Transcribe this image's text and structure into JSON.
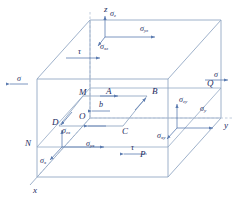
{
  "figure": {
    "type": "3d-stress-element-diagram",
    "colors": {
      "line": "#93a8c4",
      "dashed": "#b9c6d8",
      "arrow": "#5b7bb0",
      "label": "#1b2a5e",
      "background": "#ffffff"
    }
  },
  "axes": [
    {
      "name": "z-axis",
      "label": "z",
      "direction": "up"
    },
    {
      "name": "y-axis",
      "label": "y",
      "direction": "right"
    },
    {
      "name": "x-axis",
      "label": "x",
      "direction": "down-left"
    }
  ],
  "vertices": [
    {
      "name": "point-M",
      "label": "M"
    },
    {
      "name": "point-N",
      "label": "N"
    },
    {
      "name": "point-P",
      "label": "P"
    },
    {
      "name": "point-Q",
      "label": "Q"
    }
  ],
  "loop": {
    "name": "dislocation-loop",
    "corners": [
      {
        "name": "point-A",
        "label": "A"
      },
      {
        "name": "point-B",
        "label": "B"
      },
      {
        "name": "point-C",
        "label": "C"
      },
      {
        "name": "point-D",
        "label": "D"
      }
    ],
    "center": {
      "name": "point-O",
      "label": "O"
    },
    "burgers_vector": {
      "name": "burgers-vector",
      "label": "b"
    }
  },
  "stress_labels": [
    {
      "name": "sigma-z",
      "base": "σ",
      "sub": "z"
    },
    {
      "name": "sigma-yz",
      "base": "σ",
      "sub": "yz"
    },
    {
      "name": "sigma-xz",
      "base": "σ",
      "sub": "xz"
    },
    {
      "name": "sigma-y",
      "base": "σ",
      "sub": "y"
    },
    {
      "name": "sigma-zy",
      "base": "σ",
      "sub": "zy"
    },
    {
      "name": "sigma-xy",
      "base": "σ",
      "sub": "xy"
    },
    {
      "name": "sigma-x",
      "base": "σ",
      "sub": "x"
    },
    {
      "name": "sigma-zx",
      "base": "σ",
      "sub": "zx"
    },
    {
      "name": "sigma-yx",
      "base": "σ",
      "sub": "yx"
    }
  ],
  "applied": [
    {
      "name": "sigma-left",
      "label": "σ"
    },
    {
      "name": "sigma-right",
      "label": "σ"
    },
    {
      "name": "tau-top",
      "label": "τ"
    },
    {
      "name": "tau-bottom",
      "label": "τ"
    }
  ]
}
